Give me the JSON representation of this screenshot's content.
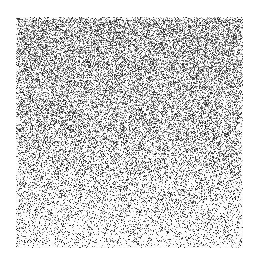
{
  "page": {
    "width": 257,
    "height": 266,
    "background_color": "#ffffff",
    "title": "Dithered Grayscale Noise Field"
  },
  "figure": {
    "name": "noise-field",
    "x": 16,
    "y": 17,
    "width": 227,
    "height": 231,
    "dot_color": "#000000",
    "field_background": "#ffffff",
    "margins": {
      "left": 16,
      "top": 17,
      "right": 14,
      "bottom": 18
    }
  },
  "chart_data": {
    "type": "heatmap",
    "title": "",
    "subtitle": "",
    "xlabel": "",
    "ylabel": "",
    "legend": [],
    "annotations": [],
    "grid": false,
    "render_style": "random-dither",
    "pixel_size": 1,
    "x": [
      0,
      227
    ],
    "xlim": [
      0,
      227
    ],
    "ylim": [
      0,
      231
    ],
    "density_axis": "vertical",
    "density_top": 0.56,
    "density_bottom": 0.17,
    "density_gamma": 1.35,
    "tone_min_gray": 20,
    "tone_max_gray": 215,
    "edge_softness_px": 3,
    "random_seed": 20240517,
    "density_profile": {
      "y_fraction": [
        0.0,
        0.1,
        0.2,
        0.3,
        0.4,
        0.5,
        0.6,
        0.7,
        0.8,
        0.9,
        1.0
      ],
      "ink_density": [
        0.56,
        0.54,
        0.51,
        0.48,
        0.45,
        0.41,
        0.36,
        0.31,
        0.26,
        0.21,
        0.17
      ]
    }
  }
}
